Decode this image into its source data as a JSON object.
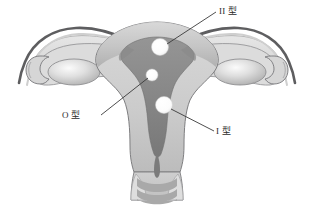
{
  "figure": {
    "background_color": "#ffffff"
  },
  "labels": [
    {
      "id": "type-2",
      "text": "II 型",
      "meaning": "Type II fibroid (intramural, fundal)",
      "x": 219,
      "y": 6
    },
    {
      "id": "type-0",
      "text": "O 型",
      "meaning": "Type O fibroid (submucosal, pedunculated)",
      "x": 62,
      "y": 110
    },
    {
      "id": "type-1",
      "text": "I 型",
      "meaning": "Type I fibroid (submucosal, intramural extension)",
      "x": 216,
      "y": 126
    }
  ],
  "fibroids": [
    {
      "id": "fibroid-type-2",
      "cx": 160,
      "cy": 47,
      "r": 8.5,
      "fill": "#ffffff"
    },
    {
      "id": "fibroid-type-0",
      "cx": 152,
      "cy": 75,
      "r": 6.0,
      "fill": "#ffffff"
    },
    {
      "id": "fibroid-type-1",
      "cx": 164,
      "cy": 105,
      "r": 8.5,
      "fill": "#ffffff"
    }
  ],
  "leader_lines": [
    {
      "id": "leader-type-2",
      "x1": 167,
      "y1": 44,
      "x2": 216,
      "y2": 12
    },
    {
      "id": "leader-type-0",
      "x1": 148,
      "y1": 78,
      "x2": 101,
      "y2": 115
    },
    {
      "id": "leader-type-1",
      "x1": 171,
      "y1": 109,
      "x2": 214,
      "y2": 131
    }
  ],
  "colors": {
    "outline_dark": "#58585a",
    "outline_mid": "#7c7c7e",
    "serosa_light": "#e3e3e3",
    "myometrium_light": "#d2d2d2",
    "myometrium_mid": "#bdbdbd",
    "endometrium_dark": "#8e8e8e",
    "cavity_dark": "#7b7b7b",
    "ovary_light": "#efefef",
    "ovary_mid": "#b9b9b9",
    "fibroid_white": "#ffffff",
    "label_text": "#2b2b2b",
    "leader_line": "#3a3a3a"
  },
  "anatomy_parts": [
    {
      "id": "uterine-fundus",
      "name": "Uterine fundus"
    },
    {
      "id": "myometrium",
      "name": "Myometrium"
    },
    {
      "id": "endometrial-cavity",
      "name": "Endometrial cavity"
    },
    {
      "id": "left-fallopian-tube",
      "name": "Left fallopian tube"
    },
    {
      "id": "right-fallopian-tube",
      "name": "Right fallopian tube"
    },
    {
      "id": "left-ovary",
      "name": "Left ovary"
    },
    {
      "id": "right-ovary",
      "name": "Right ovary"
    },
    {
      "id": "left-fimbriae",
      "name": "Left fimbriae"
    },
    {
      "id": "right-fimbriae",
      "name": "Right fimbriae"
    },
    {
      "id": "cervix",
      "name": "Cervix"
    },
    {
      "id": "cervical-canal",
      "name": "Cervical canal"
    },
    {
      "id": "vaginal-rugae",
      "name": "Vaginal rugae"
    }
  ]
}
